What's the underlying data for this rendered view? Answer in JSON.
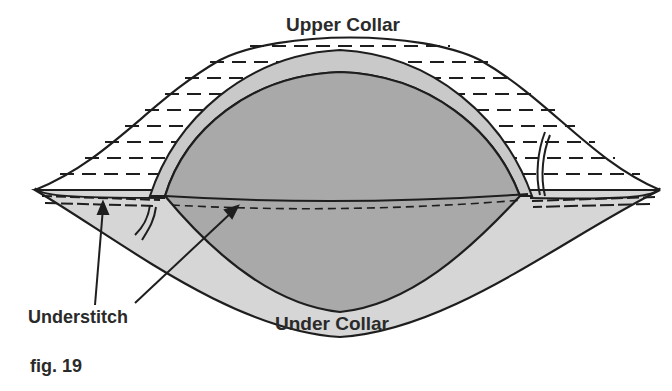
{
  "figure": {
    "caption": "fig. 19",
    "labels": {
      "upper_collar": "Upper Collar",
      "under_collar": "Under Collar",
      "understitch": "Understitch"
    },
    "colors": {
      "background": "#ffffff",
      "upper_collar_fill": "#ffffff",
      "under_collar_fill": "#d6d6d6",
      "inner_fill": "#a9a9a9",
      "seam_band_fill": "#c9c9c9",
      "outline": "#1e1e1e",
      "text": "#2a2a2a"
    }
  }
}
